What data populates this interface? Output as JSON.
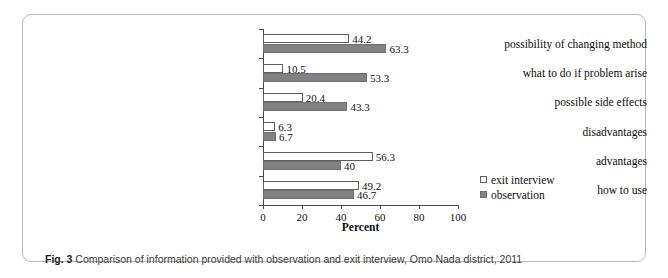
{
  "caption": {
    "prefix": "Fig. 3",
    "text": "Comparison of information provided with observation and exit interview, Omo Nada district, 2011"
  },
  "chart_data": {
    "type": "bar",
    "orientation": "horizontal",
    "title": "",
    "xlabel": "Percent",
    "ylabel": "",
    "xlim": [
      0,
      100
    ],
    "xticks": [
      0,
      20,
      40,
      60,
      80,
      100
    ],
    "grid": false,
    "legend_position": "right",
    "categories": [
      "possibility of changing method",
      "what to do if problem arise",
      "possible side effects",
      "disadvantages",
      "advantages",
      "how to use"
    ],
    "series": [
      {
        "name": "exit interview",
        "color": "#ffffff",
        "values": [
          44.2,
          10.5,
          20.4,
          6.3,
          56.3,
          49.2
        ],
        "labels": [
          "44.2",
          "10.5",
          "20.4",
          "6.3",
          "56.3",
          "49.2"
        ]
      },
      {
        "name": "observation",
        "color": "#828282",
        "values": [
          63.3,
          53.3,
          43.3,
          6.7,
          40,
          46.7
        ],
        "labels": [
          "63.3",
          "53.3",
          "43.3",
          "6.7",
          "40",
          "46.7"
        ]
      }
    ]
  }
}
